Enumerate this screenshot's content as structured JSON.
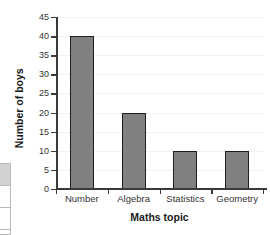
{
  "chart_data": {
    "type": "bar",
    "title": "",
    "subtitle": "",
    "categories": [
      "Number",
      "Algebra",
      "Statistics",
      "Geometry"
    ],
    "values": [
      40,
      20,
      10,
      10
    ],
    "series": [
      {
        "name": "Number of boys",
        "values": [
          40,
          20,
          10,
          10
        ]
      }
    ],
    "xlabel": "Maths topic",
    "ylabel": "Number of boys",
    "ylim": [
      0,
      45
    ],
    "ytick_step": 5,
    "yticks": [
      0,
      5,
      10,
      15,
      20,
      25,
      30,
      35,
      40,
      45
    ],
    "ytick_labels": [
      "0",
      "5",
      "10",
      "15",
      "20",
      "25",
      "30",
      "35",
      "40",
      "45"
    ],
    "grid": true,
    "grid_axis": "y",
    "legend": false,
    "legend_position": "none",
    "annotations": [],
    "colors": {
      "bar_fill": "#808080",
      "bar_edge": "#1e1e1e",
      "gridline": "#f0f0f0",
      "axis": "#3a3a3a",
      "tick_text": "#333333",
      "axis_label_text": "#1a1a1a",
      "background": "#ffffff"
    }
  },
  "edge_fragment": {
    "name": "partial-table",
    "cells": [
      "",
      "",
      ""
    ],
    "shaded_cell_index": 0,
    "border_color": "#b9b9b9",
    "shade_color": "#d2d2d2"
  }
}
